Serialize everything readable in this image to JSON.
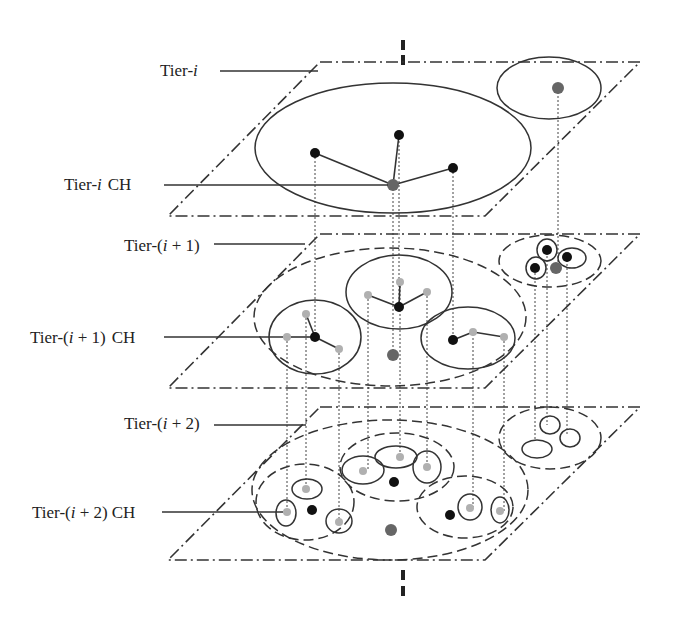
{
  "labels": {
    "tier_i": "Tier-",
    "tier_i_var": "i",
    "tier_i_ch": "Tier-",
    "tier_i_ch_var": "i",
    "tier_i_ch_suffix": "CH",
    "tier_i1_prefix": "Tier-(",
    "tier_i1_var": "i",
    "tier_i1_suffix": " + 1)",
    "tier_i1_ch_suffix": "CH",
    "tier_i2_prefix": "Tier-(",
    "tier_i2_var": "i",
    "tier_i2_suffix": " + 2)",
    "tier_i2_ch_suffix": "CH"
  },
  "colors": {
    "cluster_head_dark": "#111111",
    "cluster_head_gray": "#666666",
    "member_light": "#b0b0b0",
    "line": "#333333"
  },
  "tiers": [
    {
      "name": "Tier-i",
      "plane": "top",
      "clusters": 2,
      "head": "gray node at center"
    },
    {
      "name": "Tier-(i+1)",
      "plane": "middle",
      "clusters": 4,
      "head": "black nodes"
    },
    {
      "name": "Tier-(i+2)",
      "plane": "bottom",
      "clusters": 4,
      "head": "light gray nodes"
    }
  ]
}
